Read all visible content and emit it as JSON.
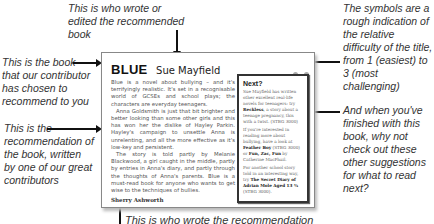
{
  "annotations": {
    "author": "This is who wrote or edited the recommended book",
    "book": "This is the book that our contributor has chosen to recommend to you",
    "recommendation": "This is the recommendation of the book, written by one of our great contributors",
    "difficulty": "The symbols are a rough indication of the relative difficulty of the title, from 1 (easiest) to 3 (most challenging)",
    "next": "And when you've finished with this book, why not check out these other suggestions for what to read next?",
    "reviewer": "This is who wrote the recommendation"
  },
  "card": {
    "title": "BLUE",
    "author": "Sue Mayfield",
    "difficulty_level": 2,
    "difficulty_symbol_color": "#aaaaaa",
    "review": [
      "Blue is a novel about bullying – and it's terrifyingly realistic. It's set in a recognisable world of GCSEs and school plays; the characters are everyday teenagers.",
      "Anna Goldsmith is just that bit brighter and better looking than some other girls and this has won her the dislike of Hayley Parkin. Hayley's campaign to unsettle Anna is unrelenting, and all the more effective as it's low-key and persistent.",
      "The story is told partly by Melanie Blackwood, a girl caught in the middle, partly by entries in Anna's diary, and partly through the thoughts of Anna's parents. Blue is a must-read book for anyone who wants to get wise to the techniques of bullies."
    ],
    "reviewer": "Sherry Ashworth",
    "next": {
      "title": "Next?",
      "items": [
        {
          "pre": "Sue Mayfield has written other excellent real-life novels for teenagers: try ",
          "bold": "Reckless",
          "post": ", a story about a teenage pregnancy, this with a twist. (STBG 3000)"
        },
        {
          "pre": "If you're interested in reading more about bullying, have a look at ",
          "bold": "Feather Boy",
          "post": " (STBG 3000) or ",
          "bold2": "Fun, Zac, Fun",
          "post2": " by Catherine MacPhail."
        },
        {
          "pre": "For another school story told in an interesting way, try ",
          "bold": "The Secret Diary of Adrian Mole Aged 13 ¾",
          "post": " (STBG 3000)."
        }
      ]
    }
  }
}
